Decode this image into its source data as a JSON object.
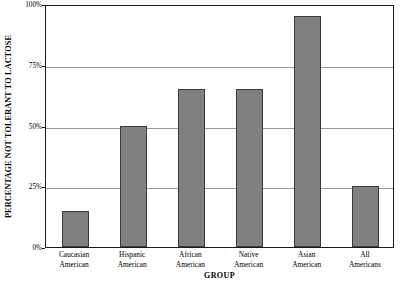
{
  "chart_data": {
    "type": "bar",
    "title": "",
    "subtitle": "",
    "xlabel": "GROUP",
    "ylabel": "PERCENTAGE NOT TOLERANT TO LACTOSE",
    "categories": [
      "Caucasian American",
      "Hispanic American",
      "African American",
      "Native American",
      "Asian American",
      "All Americans"
    ],
    "category_lines": [
      [
        "Caucasian",
        "American"
      ],
      [
        "Hispanic",
        "American"
      ],
      [
        "African",
        "American"
      ],
      [
        "Native",
        "American"
      ],
      [
        "Asian",
        "American"
      ],
      [
        "All",
        "Americans"
      ]
    ],
    "values": [
      15,
      50,
      65,
      65,
      95,
      25
    ],
    "ylim": [
      0,
      100
    ],
    "ytick_values": [
      0,
      25,
      50,
      75,
      100
    ],
    "ytick_labels": [
      "0%",
      "25%",
      "50%",
      "75%",
      "100%"
    ],
    "grid": "horizontal",
    "legend": "none",
    "bar_color": "#808080",
    "bar_border_color": "#3b3b3b",
    "gridline_color": "#9a9a9a",
    "axis_color": "#1a1a1a",
    "background_color": "#ffffff"
  }
}
